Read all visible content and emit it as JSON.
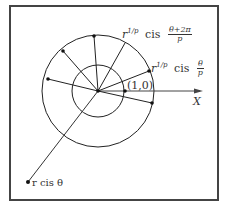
{
  "diagram": {
    "labels": {
      "root_k1_prefix": "r",
      "root_k1_exp": "1/p",
      "root_k1_cis": "cis",
      "root_k1_num": "θ+2π",
      "root_k1_den": "p",
      "root_k0_prefix": "r",
      "root_k0_exp": "1/p",
      "root_k0_cis": "cis",
      "root_k0_num": "θ",
      "root_k0_den": "p",
      "unit_point": "(1,0)",
      "x_axis": "X",
      "original_point": "r cis θ"
    },
    "geometry": {
      "center": [
        98,
        91
      ],
      "inner_radius": 26,
      "outer_radius": 56,
      "outer_roots": [
        [
          94,
          36
        ],
        [
          63,
          51
        ],
        [
          48,
          79
        ],
        [
          149,
          71
        ],
        [
          152,
          103
        ]
      ],
      "unit_point": [
        125,
        91
      ],
      "original_point": [
        28,
        182
      ],
      "x_axis_end": [
        203,
        91
      ]
    },
    "colors": {
      "stroke": "#222222",
      "frame": "#444444"
    }
  }
}
